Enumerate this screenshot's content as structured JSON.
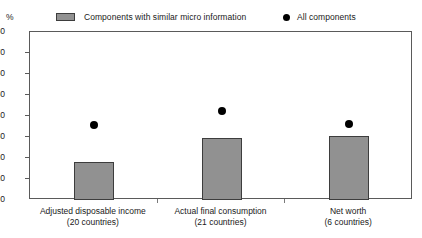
{
  "chart_data": {
    "type": "bar",
    "title": "",
    "xlabel": "",
    "ylabel": "%",
    "ylim": [
      0,
      80
    ],
    "yticks": [
      0,
      10,
      20,
      30,
      40,
      50,
      60,
      70,
      80
    ],
    "grid": false,
    "legend_position": "top",
    "categories": [
      "Adjusted disposable income",
      "Actual final consumption",
      "Net worth"
    ],
    "category_sublabels": [
      "(20 countries)",
      "(21 countries)",
      "(6 countries)"
    ],
    "series": [
      {
        "name": "Components with similar micro information",
        "type": "bar",
        "color": "#919191",
        "values": [
          18,
          29.5,
          30.5
        ]
      },
      {
        "name": "All components",
        "type": "scatter",
        "color": "#000000",
        "values": [
          35.5,
          42.5,
          36
        ]
      }
    ]
  },
  "legend": {
    "items": [
      {
        "label": "Components with similar micro information",
        "marker": "square-swatch"
      },
      {
        "label": "All components",
        "marker": "filled-circle"
      }
    ]
  },
  "axis": {
    "unit_label": "%",
    "y_tick_labels": [
      "80",
      "70",
      "60",
      "50",
      "40",
      "30",
      "20",
      "10",
      "0"
    ]
  }
}
